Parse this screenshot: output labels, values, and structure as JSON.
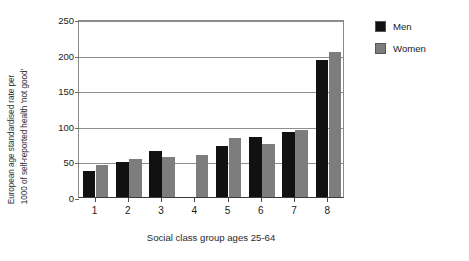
{
  "chart_data": {
    "type": "bar",
    "title": "",
    "subtitle": "",
    "xlabel": "Social class group ages 25-64",
    "ylabel_line1": "European age standardised rate per",
    "ylabel_line2": "1000 of self-reported health 'not good'",
    "categories": [
      "1",
      "2",
      "3",
      "4",
      "5",
      "6",
      "7",
      "8"
    ],
    "series": [
      {
        "name": "Men",
        "color": "#111111",
        "values": [
          36,
          49,
          64,
          null,
          72,
          84,
          91,
          193
        ]
      },
      {
        "name": "Women",
        "color": "#7d7d7d",
        "values": [
          45,
          53,
          56,
          59,
          83,
          74,
          94,
          203
        ]
      }
    ],
    "ylim": [
      0,
      250
    ],
    "yticks": [
      0,
      50,
      100,
      150,
      200,
      250
    ],
    "ytick_labels": [
      "0",
      "50",
      "100",
      "150",
      "200",
      "250"
    ],
    "grid": true,
    "grid_axis": "y",
    "legend_position": "right-outside",
    "legend_entries": [
      "Men",
      "Women"
    ]
  }
}
